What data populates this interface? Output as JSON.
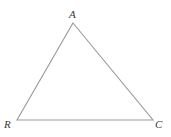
{
  "figure": {
    "kind": "geometry-diagram",
    "shape": "triangle",
    "name": "Triangle ARC",
    "background_color": "#ffffff",
    "stroke_color": "#9a9a9a",
    "stroke_width": 1.1,
    "label_color": "#3a3a3a",
    "canvas": {
      "width": 171,
      "height": 137
    },
    "vertices": [
      {
        "id": "A",
        "label": "A",
        "x": 73,
        "y": 23,
        "label_x": 69,
        "label_y": 9
      },
      {
        "id": "R",
        "label": "R",
        "x": 17,
        "y": 120,
        "label_x": 4,
        "label_y": 119
      },
      {
        "id": "C",
        "label": "C",
        "x": 153,
        "y": 120,
        "label_x": 155,
        "label_y": 119
      }
    ],
    "edges": [
      {
        "id": "RA",
        "from": "R",
        "to": "A"
      },
      {
        "id": "AC",
        "from": "A",
        "to": "C"
      },
      {
        "id": "RC",
        "from": "R",
        "to": "C"
      }
    ],
    "polygon_points": "73,23 153,120 17,120"
  }
}
